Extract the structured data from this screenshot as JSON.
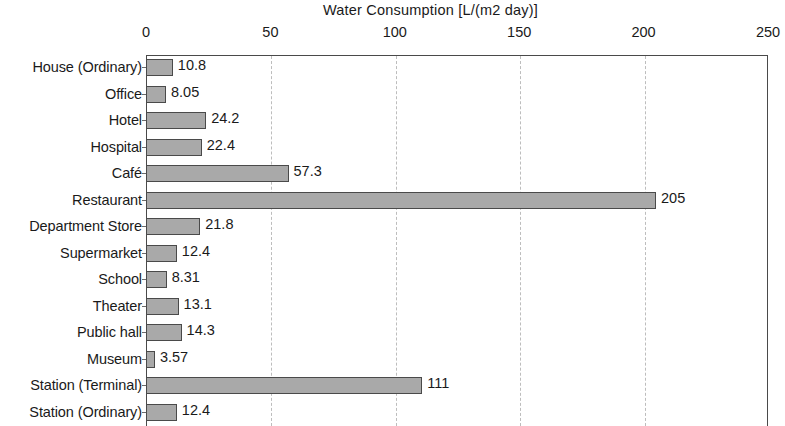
{
  "chart_data": {
    "type": "bar",
    "orientation": "horizontal",
    "title": "Water Consumption [L/(m2 day)]",
    "xlabel": "Water Consumption [L/(m2 day)]",
    "ylabel": "",
    "xlim": [
      0,
      250
    ],
    "ylim": null,
    "grid": true,
    "grid_axis": "x",
    "grid_style": "dashed",
    "legend": false,
    "axis_position": "top",
    "xticks": [
      0,
      50,
      100,
      150,
      200,
      250
    ],
    "xtick_labels": [
      "0",
      "50",
      "100",
      "150",
      "200",
      "250"
    ],
    "categories": [
      "House (Ordinary)",
      "Office",
      "Hotel",
      "Hospital",
      "Café",
      "Restaurant",
      "Department Store",
      "Supermarket",
      "School",
      "Theater",
      "Public hall",
      "Museum",
      "Station (Terminal)",
      "Station (Ordinary)"
    ],
    "values": [
      10.8,
      8.05,
      24.2,
      22.4,
      57.3,
      205,
      21.8,
      12.4,
      8.31,
      13.1,
      14.3,
      3.57,
      111,
      12.4
    ],
    "value_labels": [
      "10.8",
      "8.05",
      "24.2",
      "22.4",
      "57.3",
      "205",
      "21.8",
      "12.4",
      "8.31",
      "13.1",
      "14.3",
      "3.57",
      "111",
      "12.4"
    ],
    "colors": {
      "bar_fill": "#a9a9a9",
      "bar_border": "#4a4a4a",
      "grid": "#bdbdbd",
      "text": "#1a1a1a",
      "background": "#ffffff"
    }
  }
}
